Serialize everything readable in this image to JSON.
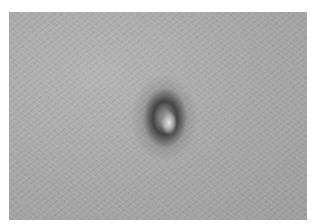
{
  "image": {
    "description": "Grayscale close-up photograph of skin with a dark circular lesion with a pale center",
    "colors": {
      "skin": "#a9a9a9",
      "lesion_ring": "#3c3c3c",
      "lesion_center": "#e0e0e0",
      "border": "#ffffff"
    }
  }
}
